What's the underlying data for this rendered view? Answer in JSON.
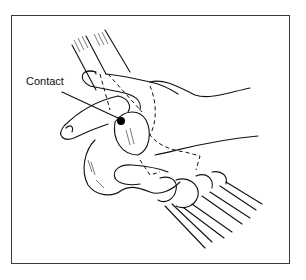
{
  "figure": {
    "annotations": [
      {
        "label": "Contact",
        "points_to": "contact-point"
      }
    ],
    "colors": {
      "line": "#111111",
      "frame": "#3a3a3a",
      "background": "#ffffff"
    }
  }
}
